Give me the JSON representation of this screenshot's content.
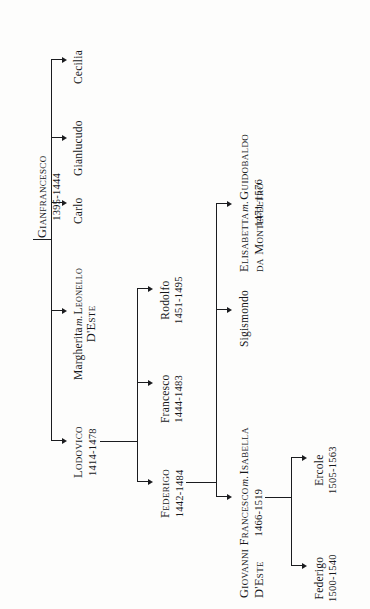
{
  "diagram": {
    "ink_color": "#1b1c1f",
    "background": "#fdfdfc",
    "text_orientation": "rotated-90-ccw"
  },
  "people": {
    "gianfrancesco": {
      "name": "Gianfrancesco",
      "dates": "1395-1444"
    },
    "cecilia": {
      "name": "Cecilia",
      "dates": ""
    },
    "gianlucudo": {
      "name": "Gianlucudo",
      "dates": ""
    },
    "carlo": {
      "name": "Carlo",
      "dates": ""
    },
    "margherita": {
      "name": "Margherita",
      "marriage": "m.",
      "spouse_line1": "Leonello",
      "spouse_line2": "D'Este",
      "dates": ""
    },
    "lodovico": {
      "name": "Lodovico",
      "dates": "1414-1478"
    },
    "rodolfo": {
      "name": "Rodolfo",
      "dates": "1451-1495"
    },
    "francesco": {
      "name": "Francesco",
      "dates": "1444-1483"
    },
    "federigo": {
      "name": "Federigo",
      "dates": "1442-1484"
    },
    "elisabetta": {
      "name": "Elisabetta",
      "marriage": "m.",
      "spouse_line1": "Guidobaldo",
      "spouse_line2": "da Montefeltro",
      "dates": "1471-1576"
    },
    "sigismondo": {
      "name": "Sigismondo",
      "dates": ""
    },
    "giovanni_francesco": {
      "name": "Giovanni Francesco",
      "marriage": "m.",
      "spouse_line1": "Isabella",
      "spouse_line2": "D'Este",
      "dates": "1466-1519"
    },
    "ercole": {
      "name": "Ercole",
      "dates": "1505-1563"
    },
    "federigo2": {
      "name": "Federigo",
      "dates": "1500-1540"
    }
  },
  "relations": [
    {
      "parent": "gianfrancesco",
      "children": [
        "lodovico",
        "margherita",
        "carlo",
        "gianlucudo",
        "cecilia"
      ]
    },
    {
      "parent": "lodovico",
      "children": [
        "federigo",
        "francesco",
        "rodolfo"
      ]
    },
    {
      "parent": "federigo",
      "children": [
        "giovanni_francesco",
        "sigismondo",
        "elisabetta"
      ]
    },
    {
      "parent": "giovanni_francesco",
      "children": [
        "federigo2",
        "ercole"
      ]
    }
  ]
}
